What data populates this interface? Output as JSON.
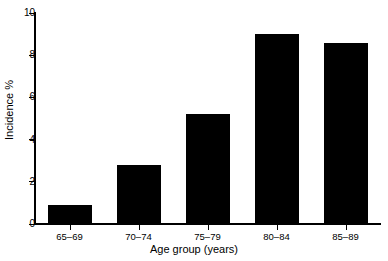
{
  "chart_data": {
    "type": "bar",
    "title": "",
    "subtitle": "",
    "xlabel": "Age group (years)",
    "ylabel": "Incidence %",
    "categories": [
      "65–69",
      "70–74",
      "75–79",
      "80–84",
      "85–89"
    ],
    "values": [
      0.9,
      2.8,
      5.2,
      9.0,
      8.6
    ],
    "series": [
      {
        "name": "Incidence %",
        "values": [
          0.9,
          2.8,
          5.2,
          9.0,
          8.6
        ]
      }
    ],
    "ylim": [
      0,
      10
    ],
    "yticks": [
      0,
      2,
      4,
      6,
      8,
      10
    ],
    "ytick_labels": [
      "0",
      "2",
      "4",
      "6",
      "8",
      "10"
    ],
    "xtick_labels": [
      "65–69",
      "70–74",
      "75–79",
      "80–84",
      "85–89"
    ],
    "grid": false,
    "legend": false,
    "legend_position": "none",
    "bar_color": "#000000",
    "axis_color": "#000000",
    "background_color": "#ffffff",
    "annotations": []
  },
  "axis": {
    "y_title": "Incidence %",
    "x_title": "Age group (years)"
  }
}
